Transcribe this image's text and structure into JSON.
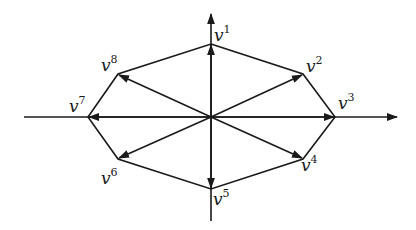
{
  "diagram": {
    "axes": {
      "horizontal": "x-axis with arrow to right",
      "vertical": "y-axis with arrow upward"
    },
    "vectors": [
      {
        "name": "v",
        "index": "1"
      },
      {
        "name": "v",
        "index": "2"
      },
      {
        "name": "v",
        "index": "3"
      },
      {
        "name": "v",
        "index": "4"
      },
      {
        "name": "v",
        "index": "5"
      },
      {
        "name": "v",
        "index": "6"
      },
      {
        "name": "v",
        "index": "7"
      },
      {
        "name": "v",
        "index": "8"
      }
    ],
    "colors": {
      "ink": "#1a1a1a",
      "background": "#ffffff"
    }
  }
}
